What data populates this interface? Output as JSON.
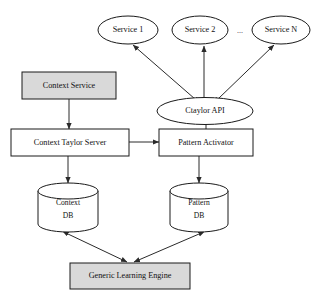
{
  "diagram": {
    "background_color": "#ffffff",
    "fill_gray": "#d9d9d9",
    "fill_white": "#ffffff",
    "stroke_color": "#1a1a1a",
    "ellipsis_between_services": "...",
    "nodes": [
      {
        "id": "service1",
        "label": "Service 1",
        "shape": "ellipse",
        "fill": "white"
      },
      {
        "id": "service2",
        "label": "Service 2",
        "shape": "ellipse",
        "fill": "white"
      },
      {
        "id": "serviceN",
        "label": "Service N",
        "shape": "ellipse",
        "fill": "white"
      },
      {
        "id": "ctaylorapi",
        "label": "Ctaylor API",
        "shape": "ellipse",
        "fill": "white"
      },
      {
        "id": "contextservice",
        "label": "Context Service",
        "shape": "box",
        "fill": "gray"
      },
      {
        "id": "contexttaylor",
        "label": "Context Taylor Server",
        "shape": "box",
        "fill": "white"
      },
      {
        "id": "patternactivator",
        "label": "Pattern Activator",
        "shape": "box",
        "fill": "white"
      },
      {
        "id": "contextdb",
        "label_line1": "Context",
        "label_line2": "DB",
        "shape": "cylinder",
        "fill": "white"
      },
      {
        "id": "patterndb",
        "label_line1": "Pattern",
        "label_line2": "DB",
        "shape": "cylinder",
        "fill": "white"
      },
      {
        "id": "learningengine",
        "label": "Generic Learning Engine",
        "shape": "box",
        "fill": "gray"
      }
    ],
    "edges": [
      {
        "from": "ctaylorapi",
        "to": "service1",
        "arrow": "both"
      },
      {
        "from": "ctaylorapi",
        "to": "service2",
        "arrow": "both"
      },
      {
        "from": "ctaylorapi",
        "to": "serviceN",
        "arrow": "both"
      },
      {
        "from": "ctaylorapi",
        "to": "patternactivator",
        "arrow": "none"
      },
      {
        "from": "contextservice",
        "to": "contexttaylor",
        "arrow": "both"
      },
      {
        "from": "contexttaylor",
        "to": "patternactivator",
        "arrow": "both"
      },
      {
        "from": "contexttaylor",
        "to": "contextdb",
        "arrow": "both"
      },
      {
        "from": "patternactivator",
        "to": "patterndb",
        "arrow": "both"
      },
      {
        "from": "contextdb",
        "to": "learningengine",
        "arrow": "both"
      },
      {
        "from": "patterndb",
        "to": "learningengine",
        "arrow": "both"
      }
    ]
  }
}
